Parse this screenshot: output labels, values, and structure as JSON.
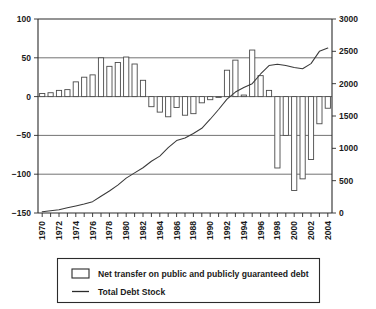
{
  "chart_data": {
    "type": "bar",
    "title": "",
    "subtitle": "",
    "xlabel": "",
    "ylabel": "",
    "y2label": "",
    "grid": true,
    "legend_position": "bottom",
    "x": [
      1970,
      1971,
      1972,
      1973,
      1974,
      1975,
      1976,
      1977,
      1978,
      1979,
      1980,
      1981,
      1982,
      1983,
      1984,
      1985,
      1986,
      1987,
      1988,
      1989,
      1990,
      1991,
      1992,
      1993,
      1994,
      1995,
      1996,
      1997,
      1998,
      1999,
      2000,
      2001,
      2002,
      2003,
      2004
    ],
    "categories": [
      "1970",
      "1971",
      "1972",
      "1973",
      "1974",
      "1975",
      "1976",
      "1977",
      "1978",
      "1979",
      "1980",
      "1981",
      "1982",
      "1983",
      "1984",
      "1985",
      "1986",
      "1987",
      "1988",
      "1989",
      "1990",
      "1991",
      "1992",
      "1993",
      "1994",
      "1995",
      "1996",
      "1997",
      "1998",
      "1999",
      "2000",
      "2001",
      "2002",
      "2003",
      "2004"
    ],
    "xtick_labels_shown": [
      "1970",
      "1972",
      "1974",
      "1976",
      "1978",
      "1980",
      "1982",
      "1984",
      "1986",
      "1988",
      "1990",
      "1992",
      "1994",
      "1996",
      "1998",
      "2000",
      "2002",
      "2004"
    ],
    "xlim": [
      1969.5,
      2004.5
    ],
    "ylim": [
      -150,
      100
    ],
    "ytick_labels": [
      "100",
      "50",
      "0",
      "-50",
      "-100",
      "-150"
    ],
    "ytick_values": [
      100,
      50,
      0,
      -50,
      -100,
      -150
    ],
    "y2lim": [
      0,
      3000
    ],
    "y2tick_labels": [
      "3000",
      "2500",
      "2000",
      "1500",
      "1000",
      "500",
      "0"
    ],
    "y2tick_values": [
      3000,
      2500,
      2000,
      1500,
      1000,
      500,
      0
    ],
    "series": [
      {
        "name": "Net transfer on public and publicly guaranteed debt",
        "type": "bar",
        "axis": "left",
        "values": [
          4,
          5,
          8,
          9,
          19,
          25,
          28,
          50,
          39,
          44,
          51,
          42,
          21,
          -13,
          -20,
          -26,
          -14,
          -24,
          -22,
          -8,
          -4,
          -1,
          34,
          47,
          2,
          60,
          27,
          8,
          -92,
          -50,
          -121,
          -106,
          -81,
          -35,
          -15
        ]
      },
      {
        "name": "Total Debt Stock",
        "type": "line",
        "axis": "right",
        "values": [
          20,
          35,
          50,
          80,
          110,
          140,
          175,
          260,
          340,
          430,
          540,
          620,
          700,
          800,
          880,
          1010,
          1120,
          1160,
          1230,
          1310,
          1450,
          1600,
          1760,
          1870,
          1940,
          2000,
          2150,
          2280,
          2300,
          2280,
          2250,
          2230,
          2310,
          2500,
          2550
        ]
      }
    ]
  },
  "legend": {
    "entries": [
      {
        "label": "Net transfer on public and publicly guaranteed debt",
        "marker": "bar-swatch-icon"
      },
      {
        "label": "Total Debt Stock",
        "marker": "line-swatch-icon"
      }
    ]
  }
}
